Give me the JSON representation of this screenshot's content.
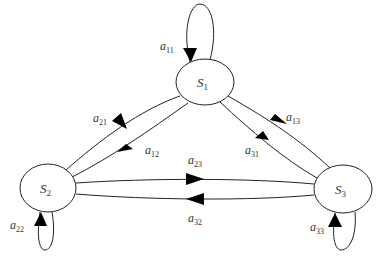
{
  "diagram": {
    "type": "state-transition-graph",
    "nodes": [
      {
        "id": "S1",
        "base": "S",
        "sub": "1"
      },
      {
        "id": "S2",
        "base": "S",
        "sub": "2"
      },
      {
        "id": "S3",
        "base": "S",
        "sub": "3"
      }
    ],
    "edges": [
      {
        "from": "S1",
        "to": "S1",
        "base": "a",
        "sub": "11"
      },
      {
        "from": "S2",
        "to": "S1",
        "base": "a",
        "sub": "21"
      },
      {
        "from": "S1",
        "to": "S2",
        "base": "a",
        "sub": "12"
      },
      {
        "from": "S1",
        "to": "S3",
        "base": "a",
        "sub": "13"
      },
      {
        "from": "S3",
        "to": "S1",
        "base": "a",
        "sub": "31"
      },
      {
        "from": "S2",
        "to": "S3",
        "base": "a",
        "sub": "23"
      },
      {
        "from": "S3",
        "to": "S2",
        "base": "a",
        "sub": "32"
      },
      {
        "from": "S2",
        "to": "S2",
        "base": "a",
        "sub": "22"
      },
      {
        "from": "S3",
        "to": "S3",
        "base": "a",
        "sub": "33"
      }
    ]
  }
}
